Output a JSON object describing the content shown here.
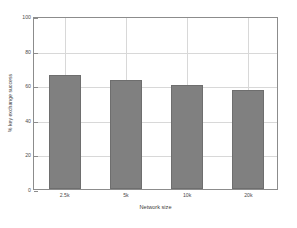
{
  "chart_data": {
    "type": "bar",
    "title": "",
    "categories": [
      "2.5k",
      "5k",
      "10k",
      "20k"
    ],
    "values": [
      66,
      63,
      60,
      57
    ],
    "series": [
      {
        "name": "% key exchange success",
        "values": [
          66,
          63,
          60,
          57
        ]
      }
    ],
    "xlabel": "Network size",
    "ylabel": "% key exchange success",
    "ylim": [
      0,
      100
    ],
    "yticks": [
      0,
      20,
      40,
      60,
      80,
      100
    ],
    "ytick_labels": [
      "0",
      "20",
      "40",
      "60",
      "80",
      "100"
    ],
    "xtick_labels": [
      "2.5k",
      "5k",
      "10k",
      "20k"
    ],
    "grid": true,
    "legend": false,
    "bar_color": "#808080",
    "bar_edge_color": "#6e6e6e",
    "grid_color": "#d8d8d8",
    "axis_color": "#8c8c8c",
    "background_color": "#ffffff"
  }
}
